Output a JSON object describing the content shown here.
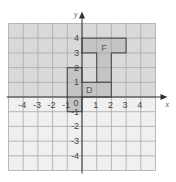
{
  "diagram": {
    "type": "coordinate-grid",
    "axes": {
      "x_label": "x",
      "y_label": "y",
      "x_ticks": [
        "-4",
        "-3",
        "-2",
        "-1",
        "1",
        "2",
        "3",
        "4"
      ],
      "x_tick_values": [
        -4,
        -3,
        -2,
        -1,
        1,
        2,
        3,
        4
      ],
      "y_ticks": [
        "4",
        "3",
        "2",
        "1",
        "-1",
        "-2",
        "-3",
        "-4"
      ],
      "y_tick_values": [
        4,
        3,
        2,
        1,
        -1,
        -2,
        -3,
        -4
      ],
      "origin_label": "0",
      "range": {
        "xmin": -5,
        "xmax": 5,
        "ymin": -5,
        "ymax": 5
      }
    },
    "shapes": [
      {
        "label": "F",
        "label_pos": [
          1.5,
          3.3
        ],
        "vertices": [
          [
            0,
            1
          ],
          [
            2,
            1
          ],
          [
            2,
            3
          ],
          [
            3,
            3
          ],
          [
            3,
            4
          ],
          [
            0,
            4
          ],
          [
            0,
            3
          ],
          [
            1,
            3
          ],
          [
            1,
            1
          ]
        ],
        "outline": [
          [
            1,
            1
          ],
          [
            2,
            1
          ],
          [
            2,
            3
          ],
          [
            3,
            3
          ],
          [
            3,
            4
          ],
          [
            0,
            4
          ],
          [
            0,
            3
          ],
          [
            1,
            3
          ]
        ]
      },
      {
        "label": "D",
        "label_pos": [
          0.5,
          0.5
        ],
        "outline": [
          [
            -1,
            2
          ],
          [
            0,
            2
          ],
          [
            0,
            1
          ],
          [
            2,
            1
          ],
          [
            2,
            0
          ],
          [
            0,
            0
          ],
          [
            0,
            -1
          ],
          [
            -1,
            -1
          ]
        ]
      }
    ],
    "colors": {
      "upper_bg": "#d9d9d9",
      "lower_bg": "#f0f0f0",
      "grid": "#a8a8a8",
      "axis": "#333333",
      "shape_fill": "#c4c4c4",
      "shape_stroke": "#555555"
    }
  }
}
